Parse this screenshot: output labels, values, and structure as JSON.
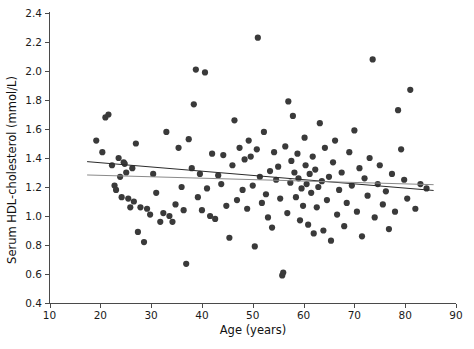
{
  "chart_data": {
    "type": "scatter",
    "title": "",
    "xlabel": "Age (years)",
    "ylabel": "Serum HDL-cholesterol  (mmol/L)",
    "xlim": [
      10,
      90
    ],
    "ylim": [
      0.4,
      2.4
    ],
    "xticks": [
      10,
      20,
      30,
      40,
      50,
      60,
      70,
      80,
      90
    ],
    "xtick_labels": [
      "10",
      "20",
      "30",
      "40",
      "50",
      "60",
      "70",
      "80",
      "90"
    ],
    "yticks": [
      0.4,
      0.6,
      0.8,
      1.0,
      1.2,
      1.4,
      1.6,
      1.8,
      2.0,
      2.2,
      2.4
    ],
    "ytick_labels": [
      "0.4",
      "0.6",
      "0.8",
      "1.0",
      "1.2",
      "1.4",
      "1.6",
      "1.8",
      "2.0",
      "2.2",
      "2.4"
    ],
    "grid": false,
    "legend": null,
    "marker_color": "#3a3a3a",
    "marker_size": 4,
    "series": [
      {
        "name": "Subjects",
        "type": "scatter",
        "points": [
          [
            19.2,
            1.52
          ],
          [
            20.4,
            1.44
          ],
          [
            21.0,
            1.68
          ],
          [
            21.6,
            1.7
          ],
          [
            22.3,
            1.35
          ],
          [
            22.8,
            1.21
          ],
          [
            23.1,
            1.18
          ],
          [
            23.6,
            1.4
          ],
          [
            23.9,
            1.27
          ],
          [
            24.2,
            1.13
          ],
          [
            24.6,
            1.37
          ],
          [
            24.8,
            1.36
          ],
          [
            25.1,
            1.3
          ],
          [
            25.5,
            1.12
          ],
          [
            25.9,
            1.06
          ],
          [
            26.3,
            1.33
          ],
          [
            26.6,
            1.1
          ],
          [
            27.0,
            1.5
          ],
          [
            27.4,
            0.89
          ],
          [
            27.9,
            1.06
          ],
          [
            28.6,
            0.82
          ],
          [
            29.2,
            1.05
          ],
          [
            29.8,
            1.01
          ],
          [
            30.4,
            1.29
          ],
          [
            31.0,
            1.16
          ],
          [
            31.8,
            0.96
          ],
          [
            32.4,
            1.02
          ],
          [
            33.0,
            1.58
          ],
          [
            33.6,
            1.0
          ],
          [
            34.2,
            0.96
          ],
          [
            34.8,
            1.08
          ],
          [
            35.4,
            1.47
          ],
          [
            36.0,
            1.2
          ],
          [
            36.4,
            1.04
          ],
          [
            36.9,
            0.67
          ],
          [
            37.4,
            1.53
          ],
          [
            38.0,
            1.33
          ],
          [
            38.4,
            1.77
          ],
          [
            38.8,
            2.01
          ],
          [
            39.2,
            1.13
          ],
          [
            39.6,
            1.29
          ],
          [
            40.0,
            1.04
          ],
          [
            40.6,
            1.99
          ],
          [
            41.0,
            1.19
          ],
          [
            41.6,
            1.0
          ],
          [
            42.0,
            1.43
          ],
          [
            42.6,
            0.98
          ],
          [
            43.2,
            1.28
          ],
          [
            43.8,
            1.22
          ],
          [
            44.2,
            1.42
          ],
          [
            44.8,
            1.07
          ],
          [
            45.4,
            0.85
          ],
          [
            46.0,
            1.35
          ],
          [
            46.4,
            1.66
          ],
          [
            46.9,
            1.11
          ],
          [
            47.4,
            1.47
          ],
          [
            48.0,
            1.18
          ],
          [
            48.4,
            1.39
          ],
          [
            48.9,
            1.05
          ],
          [
            49.2,
            1.52
          ],
          [
            49.6,
            1.41
          ],
          [
            50.0,
            1.21
          ],
          [
            50.4,
            0.79
          ],
          [
            50.8,
            1.46
          ],
          [
            51.0,
            2.23
          ],
          [
            51.4,
            1.27
          ],
          [
            51.8,
            1.09
          ],
          [
            52.2,
            1.58
          ],
          [
            52.6,
            1.15
          ],
          [
            53.0,
            0.99
          ],
          [
            53.4,
            1.31
          ],
          [
            53.8,
            0.92
          ],
          [
            54.2,
            1.44
          ],
          [
            54.6,
            1.25
          ],
          [
            55.0,
            1.34
          ],
          [
            55.4,
            1.12
          ],
          [
            55.8,
            0.59
          ],
          [
            56.0,
            0.61
          ],
          [
            56.4,
            1.48
          ],
          [
            56.8,
            1.02
          ],
          [
            57.0,
            1.79
          ],
          [
            57.4,
            1.23
          ],
          [
            57.6,
            1.38
          ],
          [
            57.9,
            1.69
          ],
          [
            58.2,
            1.3
          ],
          [
            58.5,
            1.13
          ],
          [
            58.8,
            1.43
          ],
          [
            59.0,
            1.26
          ],
          [
            59.3,
            0.97
          ],
          [
            59.6,
            1.19
          ],
          [
            59.9,
            1.07
          ],
          [
            60.2,
            1.54
          ],
          [
            60.4,
            1.35
          ],
          [
            60.6,
            1.22
          ],
          [
            60.9,
            0.94
          ],
          [
            61.2,
            1.29
          ],
          [
            61.5,
            1.16
          ],
          [
            61.8,
            1.41
          ],
          [
            62.0,
            0.88
          ],
          [
            62.3,
            1.32
          ],
          [
            62.6,
            1.06
          ],
          [
            62.9,
            1.2
          ],
          [
            63.2,
            1.64
          ],
          [
            63.6,
            1.24
          ],
          [
            63.9,
            0.9
          ],
          [
            64.2,
            1.47
          ],
          [
            64.6,
            1.11
          ],
          [
            65.0,
            1.27
          ],
          [
            65.4,
            0.83
          ],
          [
            65.8,
            1.37
          ],
          [
            66.2,
            1.52
          ],
          [
            66.6,
            1.01
          ],
          [
            67.0,
            1.18
          ],
          [
            67.5,
            1.3
          ],
          [
            68.0,
            0.93
          ],
          [
            68.5,
            1.09
          ],
          [
            69.0,
            1.44
          ],
          [
            69.5,
            1.21
          ],
          [
            70.0,
            1.59
          ],
          [
            70.5,
            1.03
          ],
          [
            71.0,
            1.33
          ],
          [
            71.5,
            0.86
          ],
          [
            72.0,
            1.26
          ],
          [
            72.6,
            1.14
          ],
          [
            73.0,
            1.4
          ],
          [
            73.6,
            2.08
          ],
          [
            74.0,
            0.99
          ],
          [
            74.6,
            1.22
          ],
          [
            75.0,
            1.35
          ],
          [
            75.6,
            1.08
          ],
          [
            76.2,
            1.17
          ],
          [
            76.8,
            0.91
          ],
          [
            77.4,
            1.29
          ],
          [
            78.0,
            1.03
          ],
          [
            78.6,
            1.73
          ],
          [
            79.2,
            1.46
          ],
          [
            79.8,
            1.25
          ],
          [
            80.4,
            1.12
          ],
          [
            81.0,
            1.87
          ],
          [
            82.0,
            1.05
          ],
          [
            83.0,
            1.22
          ],
          [
            84.2,
            1.19
          ]
        ]
      }
    ],
    "fit_lines": [
      {
        "name": "regression-line-upper",
        "color": "#2b2b2b",
        "x_start": 17.4,
        "y_start": 1.375,
        "x_end": 85.6,
        "y_end": 1.176
      },
      {
        "name": "regression-line-lower",
        "color": "#8a8a8a",
        "x_start": 17.4,
        "y_start": 1.283,
        "x_end": 85.6,
        "y_end": 1.216
      }
    ]
  }
}
